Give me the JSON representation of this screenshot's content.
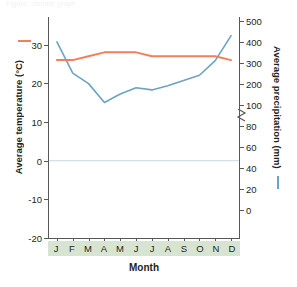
{
  "top_caption": "Figure: climate graph",
  "axes": {
    "x_title": "Month",
    "left_title": "Average temperature (°C)",
    "right_title": "Average precipitation (mm)",
    "left_ticks": [
      "30",
      "20",
      "10",
      "0",
      "-10",
      "-20"
    ],
    "right_ticks_upper": [
      "500",
      "400",
      "300",
      "200",
      "100"
    ],
    "right_ticks_lower": [
      "80",
      "60",
      "40",
      "20",
      "0"
    ],
    "axis_break": "zigzag-break-icon"
  },
  "colors": {
    "temperature_line": "#f07f5a",
    "precipitation_line": "#6ba3c4",
    "zero_gridline": "#cfe0ee",
    "axis": "#58595b",
    "month_band": "#d7e4d2"
  },
  "chart_data": {
    "type": "line",
    "title": "",
    "xlabel": "Month",
    "categories": [
      "J",
      "F",
      "M",
      "A",
      "M",
      "J",
      "J",
      "A",
      "S",
      "O",
      "N",
      "D"
    ],
    "grid": false,
    "legend_position": "axis-titles",
    "series": [
      {
        "name": "Average temperature (°C)",
        "axis": "left",
        "unit": "°C",
        "color": "#f07f5a",
        "ylabel": "Average temperature (°C)",
        "ylim": [
          -20,
          35
        ],
        "yticks": [
          -20,
          -10,
          0,
          10,
          20,
          30
        ],
        "values": [
          26,
          26,
          27,
          28,
          28,
          28,
          27,
          27,
          27,
          27,
          27,
          26
        ]
      },
      {
        "name": "Average precipitation (mm)",
        "axis": "right",
        "unit": "mm",
        "color": "#6ba3c4",
        "ylabel": "Average precipitation (mm)",
        "ylim": [
          0,
          500
        ],
        "yticks_lower": [
          0,
          20,
          40,
          60,
          80
        ],
        "yticks_upper": [
          100,
          200,
          300,
          400,
          500
        ],
        "broken_axis_between": [
          80,
          100
        ],
        "values": [
          400,
          250,
          200,
          110,
          150,
          180,
          170,
          190,
          215,
          240,
          310,
          430
        ]
      }
    ]
  }
}
